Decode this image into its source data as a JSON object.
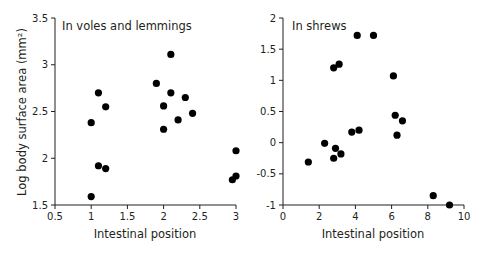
{
  "chart_data": [
    {
      "type": "scatter",
      "title": "In voles and lemmings",
      "xlabel": "Intestinal position",
      "ylabel": "Log body surface area (mm²)",
      "xlim": [
        0.5,
        3
      ],
      "ylim": [
        1.5,
        3.5
      ],
      "xticks": [
        "0.5",
        "1",
        "1.5",
        "2",
        "2.5",
        "3"
      ],
      "yticks": [
        "1.5",
        "2",
        "2.5",
        "3",
        "3.5"
      ],
      "grid": false,
      "points": [
        {
          "x": 1.0,
          "y": 2.38
        },
        {
          "x": 1.0,
          "y": 1.59
        },
        {
          "x": 1.1,
          "y": 2.7
        },
        {
          "x": 1.1,
          "y": 1.92
        },
        {
          "x": 1.2,
          "y": 2.55
        },
        {
          "x": 1.2,
          "y": 1.89
        },
        {
          "x": 1.9,
          "y": 2.8
        },
        {
          "x": 2.0,
          "y": 2.56
        },
        {
          "x": 2.0,
          "y": 2.31
        },
        {
          "x": 2.1,
          "y": 3.11
        },
        {
          "x": 2.1,
          "y": 2.7
        },
        {
          "x": 2.2,
          "y": 2.41
        },
        {
          "x": 2.3,
          "y": 2.65
        },
        {
          "x": 2.4,
          "y": 2.48
        },
        {
          "x": 2.95,
          "y": 1.77
        },
        {
          "x": 3.0,
          "y": 2.08
        },
        {
          "x": 3.0,
          "y": 1.81
        }
      ]
    },
    {
      "type": "scatter",
      "title": "In shrews",
      "xlabel": "Intestinal position",
      "ylabel": "",
      "xlim": [
        0,
        10
      ],
      "ylim": [
        -1,
        2
      ],
      "xticks": [
        "0",
        "2",
        "4",
        "6",
        "8",
        "10"
      ],
      "yticks": [
        "-1",
        "-0.5",
        "0",
        "0.5",
        "1",
        "1.5",
        "2"
      ],
      "grid": false,
      "points": [
        {
          "x": 1.4,
          "y": -0.31
        },
        {
          "x": 2.3,
          "y": -0.01
        },
        {
          "x": 2.8,
          "y": 1.2
        },
        {
          "x": 2.8,
          "y": -0.25
        },
        {
          "x": 2.9,
          "y": -0.09
        },
        {
          "x": 3.1,
          "y": 1.26
        },
        {
          "x": 3.2,
          "y": -0.18
        },
        {
          "x": 3.8,
          "y": 0.17
        },
        {
          "x": 4.1,
          "y": 1.72
        },
        {
          "x": 4.2,
          "y": 0.2
        },
        {
          "x": 5.0,
          "y": 1.72
        },
        {
          "x": 6.1,
          "y": 1.07
        },
        {
          "x": 6.2,
          "y": 0.44
        },
        {
          "x": 6.3,
          "y": 0.12
        },
        {
          "x": 6.6,
          "y": 0.35
        },
        {
          "x": 8.3,
          "y": -0.85
        },
        {
          "x": 9.2,
          "y": -1.0
        }
      ]
    }
  ],
  "panels": {
    "left": {
      "title": "In voles and lemmings",
      "xlabel": "Intestinal position",
      "ylabel": "Log body surface area (mm²)"
    },
    "right": {
      "title": "In shrews",
      "xlabel": "Intestinal position"
    }
  },
  "colors": {
    "axis": "#231f20",
    "marker": "#000000"
  }
}
